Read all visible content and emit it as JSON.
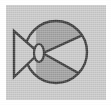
{
  "canvas": {
    "width": 111,
    "height": 105,
    "outer_background": "#ffffff",
    "panel_background": "#c9c9c9",
    "panel": {
      "x": 6,
      "y": 5,
      "width": 100,
      "height": 95
    }
  },
  "icon": {
    "name": "butterfly-valve-symbol",
    "title": "Valve schematic symbol",
    "stroke_color": "#3a3a3a",
    "stroke_width": 2,
    "shade_color": "#a0a0a0",
    "light_color": "#c9c9c9"
  },
  "shapes": {
    "circle": {
      "label": "valve body circle",
      "cx": 56,
      "cy": 52,
      "r": 32,
      "fill": "#c9c9c9",
      "stroke": "#3a3a3a"
    },
    "wedge_upper": {
      "label": "upper shaded wedge",
      "fill": "#a0a0a0"
    },
    "wedge_lower": {
      "label": "lower shaded wedge",
      "fill": "#a0a0a0"
    },
    "diagonal_upper": {
      "label": "upper diagonal chord",
      "x1": 36,
      "y1": 56,
      "x2": 86,
      "y2": 32
    },
    "diagonal_lower": {
      "label": "lower diagonal chord",
      "x1": 36,
      "y1": 48,
      "x2": 86,
      "y2": 76
    },
    "disc_ellipse": {
      "label": "valve disc ellipse",
      "cx": 38,
      "cy": 52,
      "rx": 5,
      "ry": 9,
      "fill": "#c9c9c9",
      "stroke": "#3a3a3a"
    },
    "actuator_triangle": {
      "label": "actuator triangle",
      "points": "12,30 12,76 38,52",
      "fill": "#c9c9c9",
      "stroke": "#3a3a3a"
    }
  }
}
